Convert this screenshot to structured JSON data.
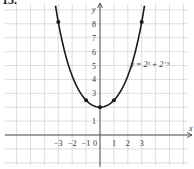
{
  "problem_number": "15.",
  "chart_data": {
    "type": "line",
    "title": "",
    "function_label": "y = 2ˣ + 2⁻ˣ",
    "xlabel": "x",
    "ylabel": "y",
    "x_ticks": [
      "−3",
      "−2",
      "−1",
      "0",
      "1",
      "2",
      "3"
    ],
    "y_ticks": [
      "1",
      "3",
      "4",
      "5",
      "6",
      "7",
      "8"
    ],
    "xlim": [
      -6.5,
      6.7
    ],
    "ylim": [
      -2.0,
      9.5
    ],
    "grid": true,
    "series": [
      {
        "name": "y = 2^x + 2^-x",
        "x": [
          -3,
          -2,
          -1,
          0,
          1,
          2,
          3
        ],
        "y": [
          8.125,
          4.25,
          2.5,
          2,
          2.5,
          4.25,
          8.125
        ]
      }
    ],
    "marked_points": [
      {
        "x": -3,
        "y": 8.125
      },
      {
        "x": -1,
        "y": 2.5
      },
      {
        "x": 0,
        "y": 2
      },
      {
        "x": 1,
        "y": 2.5
      },
      {
        "x": 3,
        "y": 8.125
      }
    ],
    "colors": {
      "grid": "#d4d4d4",
      "axis": "#555555",
      "curve": "#1a1a1a"
    }
  }
}
